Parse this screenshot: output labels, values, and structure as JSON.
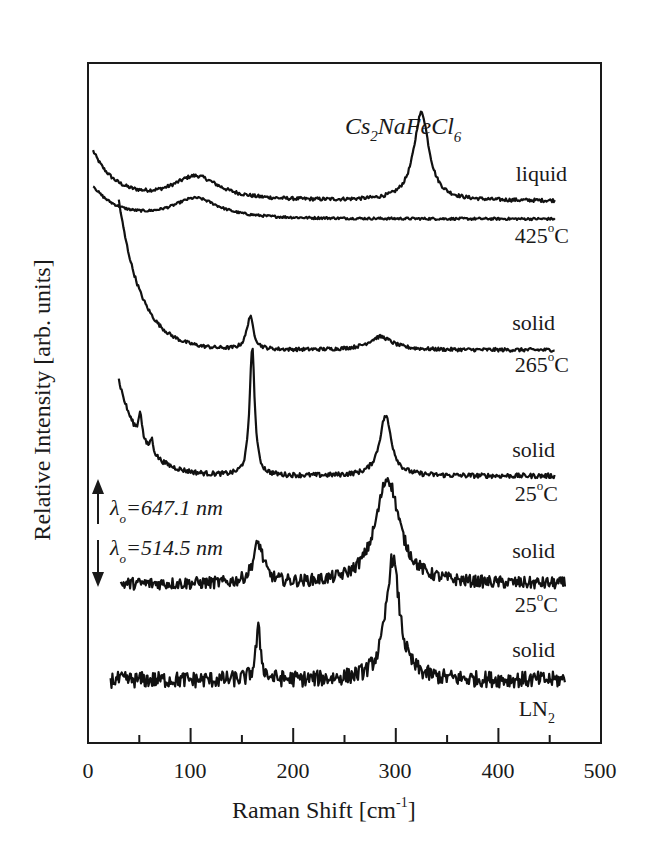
{
  "chart_data": {
    "type": "line",
    "title": "Cs2NaFeCl6",
    "title_parts": {
      "base1": "Cs",
      "sub1": "2",
      "base2": "NaFeCl",
      "sub2": "6"
    },
    "xlabel": "Raman Shift [cm-1]",
    "xlabel_parts": {
      "base": "Raman Shift [cm",
      "sup": "-1",
      "close": "]"
    },
    "ylabel": "Relative Intensity [arb. units]",
    "xlim": [
      0,
      500
    ],
    "x_ticks": [
      0,
      100,
      200,
      300,
      400,
      500
    ],
    "x_minor_ticks": [
      50,
      150,
      250,
      350,
      450
    ],
    "grid": false,
    "legend": "none (inline trace labels)",
    "annotations": [
      {
        "text": "λo=647.1 nm",
        "arrow": "up"
      },
      {
        "text": "λo=514.5 nm",
        "arrow": "down"
      }
    ],
    "series": [
      {
        "name": "liquid",
        "temp": "425°C",
        "state": "liquid",
        "excitation_nm": 647.1,
        "x_range": [
          5,
          455
        ],
        "baseline": 0.0,
        "peaks": [
          {
            "x": 105,
            "height": 0.28,
            "width": 28
          },
          {
            "x": 325,
            "height": 1.0,
            "width": 9
          }
        ],
        "rising_edge": 0.55,
        "noise": 0.02,
        "offset": 5.0
      },
      {
        "name": "425°C (reference)",
        "temp": "425°C",
        "state": "liquid",
        "excitation_nm": 647.1,
        "x_range": [
          5,
          455
        ],
        "baseline": 0.0,
        "peaks": [
          {
            "x": 105,
            "height": 0.26,
            "width": 28
          }
        ],
        "rising_edge": 0.4,
        "noise": 0.015,
        "offset": 4.75
      },
      {
        "name": "solid 265°C",
        "temp": "265°C",
        "state": "solid",
        "excitation_nm": 647.1,
        "x_range": [
          30,
          455
        ],
        "baseline": 0.0,
        "peaks": [
          {
            "x": 158,
            "height": 0.55,
            "width": 4
          },
          {
            "x": 285,
            "height": 0.22,
            "width": 14
          }
        ],
        "rising_edge": 2.5,
        "noise": 0.03,
        "offset": 3.35
      },
      {
        "name": "solid 25°C (647.1 nm)",
        "temp": "25°C",
        "state": "solid",
        "excitation_nm": 647.1,
        "x_range": [
          30,
          455
        ],
        "baseline": 0.0,
        "peaks": [
          {
            "x": 51,
            "height": 0.35,
            "width": 2
          },
          {
            "x": 62,
            "height": 0.18,
            "width": 2
          },
          {
            "x": 160,
            "height": 1.6,
            "width": 3
          },
          {
            "x": 290,
            "height": 0.75,
            "width": 7
          }
        ],
        "rising_edge": 1.2,
        "noise": 0.03,
        "offset": 2.15
      },
      {
        "name": "solid 25°C (514.5 nm)",
        "temp": "25°C",
        "state": "solid",
        "excitation_nm": 514.5,
        "x_range": [
          32,
          465
        ],
        "baseline": 0.0,
        "peaks": [
          {
            "x": 166,
            "height": 0.45,
            "width": 6
          },
          {
            "x": 292,
            "height": 1.2,
            "width": 14
          }
        ],
        "rising_edge": 0.0,
        "noise": 0.07,
        "offset": 1.0
      },
      {
        "name": "solid LN2",
        "temp": "LN2",
        "state": "solid",
        "excitation_nm": 514.5,
        "x_range": [
          22,
          465
        ],
        "baseline": 0.0,
        "peaks": [
          {
            "x": 166,
            "height": 0.55,
            "width": 3
          },
          {
            "x": 297,
            "height": 1.35,
            "width": 8
          }
        ],
        "rising_edge": 0.0,
        "noise": 0.09,
        "offset": 0.0
      }
    ]
  },
  "labels": {
    "liquid": "liquid",
    "t425": "425",
    "solid1": "solid",
    "t265": "265",
    "solid2": "solid",
    "t25a": "25",
    "solid3": "solid",
    "t25b": "25",
    "solid4": "solid",
    "ln": "LN",
    "ln_sub": "2",
    "deg": "o",
    "celsius": "C",
    "lambda1": "=647.1 nm",
    "lambda2": "=514.5 nm",
    "lambda_sym": "λ",
    "lambda_sub": "o"
  },
  "axis": {
    "x0": "0",
    "x100": "100",
    "x200": "200",
    "x300": "300",
    "x400": "400",
    "x500": "500"
  }
}
